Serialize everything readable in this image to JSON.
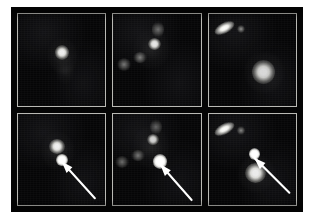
{
  "figure": {
    "layout": {
      "rows": 2,
      "columns": 3,
      "panel_count": 6
    },
    "colors": {
      "page_background": "#ffffff",
      "plate_background": "#050505",
      "panel_background": "#050506",
      "panel_border": "#b9b9b4",
      "source_highlight": "#ffffff",
      "arrow": "#ffffff"
    },
    "row_labels": [
      "before",
      "after"
    ],
    "panels": [
      {
        "id": "panel-1",
        "position": "top-left",
        "row": "before",
        "column": 1,
        "caption": "Host galaxy, compact bright nucleus with faint southern extension",
        "has_arrow": false,
        "objects": [
          {
            "name": "galaxy-core",
            "kind": "core",
            "x": 42,
            "y": 34,
            "w": 16,
            "h": 16,
            "brightness": 1.0
          },
          {
            "name": "galaxy-halo",
            "kind": "haze",
            "x": 34,
            "y": 26,
            "w": 34,
            "h": 40,
            "brightness": 0.35
          },
          {
            "name": "galaxy-tail",
            "kind": "haze",
            "x": 44,
            "y": 46,
            "w": 20,
            "h": 30,
            "brightness": 0.3
          }
        ]
      },
      {
        "id": "panel-2",
        "position": "top-middle",
        "row": "before",
        "column": 2,
        "caption": "Irregular interacting host, chain of star-forming knots",
        "has_arrow": false,
        "objects": [
          {
            "name": "knot-main",
            "kind": "core",
            "x": 40,
            "y": 26,
            "w": 15,
            "h": 13,
            "brightness": 0.95
          },
          {
            "name": "knot-upper",
            "kind": "knot",
            "x": 44,
            "y": 8,
            "w": 14,
            "h": 18,
            "brightness": 0.45
          },
          {
            "name": "knot-left",
            "kind": "knot",
            "x": 22,
            "y": 42,
            "w": 16,
            "h": 12,
            "brightness": 0.55
          },
          {
            "name": "knot-far-left",
            "kind": "knot",
            "x": 4,
            "y": 48,
            "w": 16,
            "h": 14,
            "brightness": 0.5
          },
          {
            "name": "filament-haze",
            "kind": "haze",
            "x": 24,
            "y": 16,
            "w": 40,
            "h": 44,
            "brightness": 0.3
          }
        ]
      },
      {
        "id": "panel-3",
        "position": "top-right",
        "row": "before",
        "column": 3,
        "caption": "Edge-on streak galaxy at upper left with companion dot and bright elliptical at lower right",
        "has_arrow": false,
        "objects": [
          {
            "name": "edge-on-streak",
            "kind": "streak",
            "x": 6,
            "y": 10,
            "w": 24,
            "h": 11,
            "rotate": -28,
            "brightness": 1.0
          },
          {
            "name": "companion-dot",
            "kind": "knot",
            "x": 33,
            "y": 12,
            "w": 9,
            "h": 9,
            "brightness": 0.6
          },
          {
            "name": "elliptical-galaxy",
            "kind": "core",
            "x": 50,
            "y": 50,
            "w": 26,
            "h": 26,
            "brightness": 0.9
          },
          {
            "name": "elliptical-halo",
            "kind": "haze",
            "x": 42,
            "y": 42,
            "w": 44,
            "h": 44,
            "brightness": 0.38
          }
        ]
      },
      {
        "id": "panel-4",
        "position": "bottom-left",
        "row": "after",
        "column": 1,
        "caption": "Same field as top-left with new point source south of the nucleus, marked by arrow",
        "has_arrow": true,
        "arrow": {
          "tip_x": 50,
          "tip_y": 52,
          "tail_x": 88,
          "tail_y": 92
        },
        "objects": [
          {
            "name": "galaxy-core",
            "kind": "core",
            "x": 36,
            "y": 28,
            "w": 18,
            "h": 16,
            "brightness": 1.0
          },
          {
            "name": "galaxy-halo",
            "kind": "haze",
            "x": 28,
            "y": 20,
            "w": 36,
            "h": 42,
            "brightness": 0.35
          },
          {
            "name": "supernova-point-source",
            "kind": "sn",
            "x": 44,
            "y": 44,
            "w": 13,
            "h": 13,
            "brightness": 1.0
          }
        ]
      },
      {
        "id": "panel-5",
        "position": "bottom-middle",
        "row": "after",
        "column": 2,
        "caption": "Same chain galaxy with very bright round new point source, marked by arrow",
        "has_arrow": true,
        "arrow": {
          "tip_x": 54,
          "tip_y": 55,
          "tail_x": 90,
          "tail_y": 94
        },
        "objects": [
          {
            "name": "knot-main",
            "kind": "core",
            "x": 38,
            "y": 22,
            "w": 14,
            "h": 12,
            "brightness": 0.85
          },
          {
            "name": "knot-upper",
            "kind": "knot",
            "x": 42,
            "y": 6,
            "w": 14,
            "h": 18,
            "brightness": 0.4
          },
          {
            "name": "knot-left",
            "kind": "knot",
            "x": 20,
            "y": 40,
            "w": 16,
            "h": 12,
            "brightness": 0.5
          },
          {
            "name": "knot-far-left",
            "kind": "knot",
            "x": 2,
            "y": 46,
            "w": 16,
            "h": 14,
            "brightness": 0.45
          },
          {
            "name": "filament-haze",
            "kind": "haze",
            "x": 22,
            "y": 14,
            "w": 42,
            "h": 46,
            "brightness": 0.28
          },
          {
            "name": "supernova-point-source",
            "kind": "sn",
            "x": 45,
            "y": 44,
            "w": 17,
            "h": 17,
            "brightness": 1.0
          }
        ]
      },
      {
        "id": "panel-6",
        "position": "bottom-right",
        "row": "after",
        "column": 3,
        "caption": "Same field as top-right with new point source above the elliptical galaxy, marked by arrow",
        "has_arrow": true,
        "arrow": {
          "tip_x": 52,
          "tip_y": 48,
          "tail_x": 92,
          "tail_y": 86
        },
        "objects": [
          {
            "name": "edge-on-streak",
            "kind": "streak",
            "x": 6,
            "y": 12,
            "w": 24,
            "h": 11,
            "rotate": -28,
            "brightness": 1.0
          },
          {
            "name": "companion-dot",
            "kind": "knot",
            "x": 33,
            "y": 14,
            "w": 9,
            "h": 9,
            "brightness": 0.55
          },
          {
            "name": "elliptical-galaxy",
            "kind": "core",
            "x": 42,
            "y": 54,
            "w": 24,
            "h": 22,
            "brightness": 1.0
          },
          {
            "name": "elliptical-halo",
            "kind": "haze",
            "x": 34,
            "y": 46,
            "w": 42,
            "h": 40,
            "brightness": 0.4
          },
          {
            "name": "supernova-point-source",
            "kind": "sn",
            "x": 46,
            "y": 38,
            "w": 13,
            "h": 13,
            "brightness": 1.0
          }
        ]
      }
    ]
  }
}
